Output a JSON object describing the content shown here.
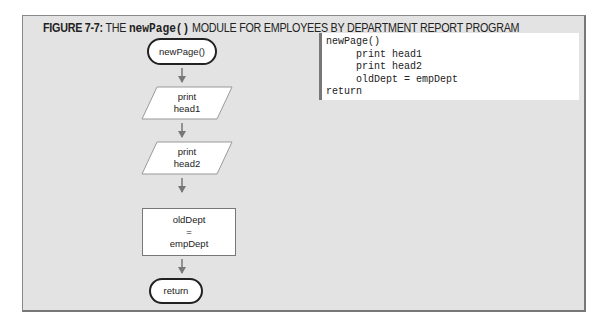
{
  "figure": {
    "label": "FIGURE 7-7:",
    "title_pre": " THE ",
    "title_code": "newPage()",
    "title_post": " MODULE FOR EMPLOYEES BY DEPARTMENT REPORT PROGRAM"
  },
  "flowchart": {
    "start": "newPage()",
    "io1": [
      "print",
      "head1"
    ],
    "io2": [
      "print",
      "head2"
    ],
    "process": [
      "oldDept",
      "=",
      "empDept"
    ],
    "end": "return"
  },
  "pseudocode": [
    "newPage()",
    "     print head1",
    "     print head2",
    "     oldDept = empDept",
    "return"
  ]
}
